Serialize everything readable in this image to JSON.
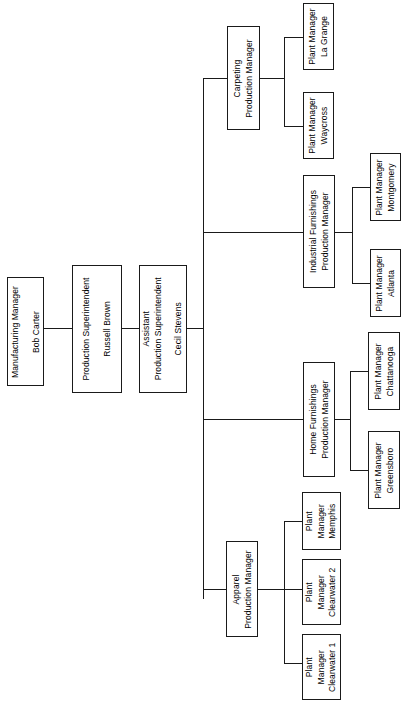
{
  "chart": {
    "orientation": "rotated-90-ccw",
    "line_color": "#1a1a1a",
    "box_fill": "#ffffff",
    "background": "#ffffff"
  },
  "nodes": {
    "manufacturing_manager": {
      "title": "Manufacturing Manager",
      "person": "Bob Carter"
    },
    "production_superintendent": {
      "title": "Production Superintendent",
      "person": "Russell Brown"
    },
    "assistant_production_superintendent": {
      "title_line1": "Assistant",
      "title_line2": "Production Superintendent",
      "person": "Cecil Stevens"
    },
    "carpeting": {
      "line1": "Carpeting",
      "line2": "Production Manager"
    },
    "industrial_furnishings": {
      "line1": "Industrial Furnishings",
      "line2": "Production Manager"
    },
    "home_furnishings": {
      "line1": "Home Furnishings",
      "line2": "Production Manager"
    },
    "apparel": {
      "line1": "Apparel",
      "line2": "Production Manager"
    },
    "plant_la_grange": {
      "line1": "Plant Manager",
      "line2": "La Grange"
    },
    "plant_waycross": {
      "line1": "Plant Manager",
      "line2": "Waycross"
    },
    "plant_montgomery": {
      "line1": "Plant Manager",
      "line2": "Montgomery"
    },
    "plant_atlanta": {
      "line1": "Plant Manager",
      "line2": "Atlanta"
    },
    "plant_chattanooga": {
      "line1": "Plant Manager",
      "line2": "Chattanooga"
    },
    "plant_greensboro": {
      "line1": "Plant Manager",
      "line2": "Greensboro"
    },
    "plant_memphis": {
      "line1": "Plant",
      "line2": "Manager",
      "line3": "Memphis"
    },
    "plant_clearwater_2": {
      "line1": "Plant",
      "line2": "Manager",
      "line3": "Clearwater 2"
    },
    "plant_clearwater_1": {
      "line1": "Plant",
      "line2": "Manager",
      "line3": "Clearwater 1"
    }
  }
}
